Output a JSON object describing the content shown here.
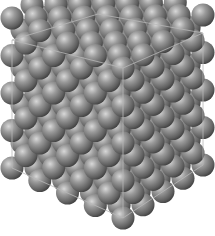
{
  "figure": {
    "sphere_color": "#8a8a8a",
    "sphere_highlight": "#d8d8d8",
    "sphere_shadow": "#3a3a3a",
    "box_edge_color": "#b8b8b8",
    "background": "#ffffff"
  },
  "lattice": {
    "cells_per_axis": 4,
    "sphere_radius": 11.5,
    "origin_bottom_front": [
      123,
      218
    ],
    "axis_right": [
      80,
      -53
    ],
    "axis_left": [
      -111,
      -50
    ],
    "axis_up": [
      0,
      -150
    ]
  },
  "box_corners": {
    "top_back": [
      98,
      14
    ],
    "top_left": [
      12,
      40
    ],
    "top_front": [
      123,
      68
    ],
    "top_right": [
      203,
      33
    ],
    "bottom_left": [
      12,
      168
    ],
    "bottom_front": [
      123,
      218
    ],
    "bottom_right": [
      203,
      165
    ],
    "bottom_back": [
      98,
      142
    ]
  }
}
